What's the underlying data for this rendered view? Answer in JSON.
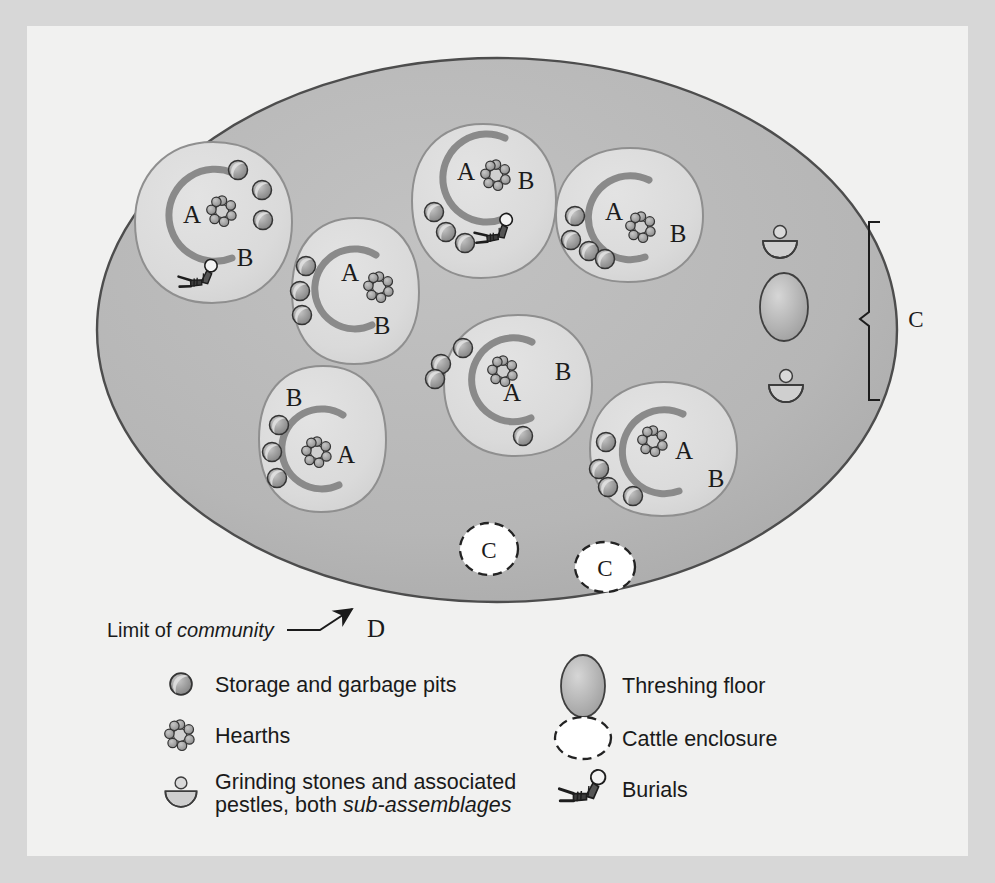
{
  "figure": {
    "zone_labels": {
      "house": "A",
      "yard": "B",
      "communal": "C",
      "community_limit": "D"
    },
    "annotation": {
      "prefix": "Limit of ",
      "italic": "community",
      "arrow_label": "D"
    },
    "colors": {
      "frame": "#d7d7d7",
      "plate": "#f1f1f0",
      "settlement_fill": "#b9b9b9",
      "settlement_stroke": "#4a4a4a",
      "household_fill": "#dcdcdc",
      "household_stroke": "#8d8d8d",
      "hut_wall": "#8a8a8a",
      "pit_fill": "#9a9a9a",
      "pit_stroke": "#3a3a3a",
      "hearth_stone": "#9e9e9e",
      "threshing_fill": "#b0b0b0",
      "enclosure_fill": "#ffffff",
      "enclosure_stroke": "#2c2c2c",
      "ink": "#1b1b1b"
    },
    "settlement": {
      "cx": 497,
      "cy": 330,
      "rx": 400,
      "ry": 272
    },
    "households": [
      {
        "id": "household-nw",
        "cx": 213,
        "cy": 222,
        "rx": 78,
        "ry": 80,
        "a_label": {
          "x": 192,
          "y": 215
        },
        "b_label": {
          "x": 245,
          "y": 258
        },
        "hearth": {
          "x": 222,
          "y": 211
        },
        "hut": {
          "cx": 210,
          "cy": 215,
          "r": 46,
          "start": 300,
          "end": 165
        },
        "pits": [
          {
            "x": 238,
            "y": 170
          },
          {
            "x": 261,
            "y": 190
          },
          {
            "x": 262,
            "y": 220
          }
        ],
        "burials": [
          {
            "x": 196,
            "y": 277,
            "rot": -12
          }
        ],
        "grinders": []
      },
      {
        "id": "household-n",
        "cx": 483,
        "cy": 200,
        "rx": 70,
        "ry": 78,
        "a_label": {
          "x": 466,
          "y": 172
        },
        "b_label": {
          "x": 523,
          "y": 180
        },
        "hearth": {
          "x": 496,
          "y": 175
        },
        "hut": {
          "cx": 483,
          "cy": 178,
          "r": 44,
          "start": 300,
          "end": 160
        },
        "pits": [
          {
            "x": 437,
            "y": 212
          },
          {
            "x": 448,
            "y": 230
          },
          {
            "x": 466,
            "y": 241
          }
        ],
        "burials": [
          {
            "x": 492,
            "y": 233,
            "rot": -14
          }
        ],
        "grinders": []
      },
      {
        "id": "household-ne",
        "cx": 628,
        "cy": 214,
        "rx": 72,
        "ry": 66,
        "a_label": {
          "x": 616,
          "y": 212
        },
        "b_label": {
          "x": 673,
          "y": 233
        },
        "hearth": {
          "x": 640,
          "y": 227
        },
        "hut": {
          "cx": 628,
          "cy": 218,
          "r": 42,
          "start": 300,
          "end": 155
        },
        "pits": [
          {
            "x": 576,
            "y": 215
          },
          {
            "x": 572,
            "y": 239
          },
          {
            "x": 589,
            "y": 250
          },
          {
            "x": 604,
            "y": 258
          }
        ],
        "burials": [],
        "grinders": []
      },
      {
        "id": "household-w",
        "cx": 355,
        "cy": 290,
        "rx": 62,
        "ry": 72,
        "a_label": {
          "x": 351,
          "y": 273
        },
        "b_label": {
          "x": 382,
          "y": 325
        },
        "hearth": {
          "x": 378,
          "y": 285
        },
        "hut": {
          "cx": 357,
          "cy": 287,
          "r": 40,
          "start": 300,
          "end": 160
        },
        "pits": [
          {
            "x": 307,
            "y": 265
          },
          {
            "x": 300,
            "y": 288
          },
          {
            "x": 301,
            "y": 310
          }
        ],
        "burials": [],
        "grinders": []
      },
      {
        "id": "household-center",
        "cx": 517,
        "cy": 385,
        "rx": 72,
        "ry": 70,
        "a_label": {
          "x": 513,
          "y": 393
        },
        "b_label": {
          "x": 561,
          "y": 371
        },
        "hearth": {
          "x": 503,
          "y": 370
        },
        "hut": {
          "cx": 512,
          "cy": 377,
          "r": 42,
          "start": 300,
          "end": 168
        },
        "pits": [
          {
            "x": 462,
            "y": 348
          },
          {
            "x": 441,
            "y": 364
          },
          {
            "x": 435,
            "y": 378
          },
          {
            "x": 522,
            "y": 436
          }
        ],
        "burials": [],
        "grinders": []
      },
      {
        "id": "household-sw",
        "cx": 322,
        "cy": 438,
        "rx": 62,
        "ry": 72,
        "a_label": {
          "x": 343,
          "y": 455
        },
        "b_label": {
          "x": 295,
          "y": 397
        },
        "hearth": {
          "x": 316,
          "y": 452
        },
        "hut": {
          "cx": 324,
          "cy": 447,
          "r": 40,
          "start": 300,
          "end": 165
        },
        "pits": [
          {
            "x": 280,
            "y": 424
          },
          {
            "x": 273,
            "y": 450
          },
          {
            "x": 277,
            "y": 476
          }
        ],
        "burials": [],
        "grinders": []
      },
      {
        "id": "household-se",
        "cx": 662,
        "cy": 447,
        "rx": 72,
        "ry": 62,
        "a_label": {
          "x": 681,
          "y": 451
        },
        "b_label": {
          "x": 713,
          "y": 478
        },
        "hearth": {
          "x": 653,
          "y": 442
        },
        "hut": {
          "cx": 662,
          "cy": 448,
          "r": 42,
          "start": 300,
          "end": 163
        },
        "pits": [
          {
            "x": 607,
            "y": 441
          },
          {
            "x": 600,
            "y": 468
          },
          {
            "x": 608,
            "y": 486
          },
          {
            "x": 632,
            "y": 495
          }
        ],
        "burials": [],
        "grinders": []
      }
    ],
    "threshing_floor": {
      "cx": 784,
      "cy": 307,
      "rx": 23,
      "ry": 33
    },
    "communal_grinders": [
      {
        "x": 780,
        "y": 238
      },
      {
        "x": 784,
        "y": 382
      }
    ],
    "communal_bracket": {
      "x": 872,
      "y_top": 222,
      "y_bottom": 400,
      "label": "C",
      "label_x": 916,
      "label_y": 319
    },
    "cattle_enclosures": [
      {
        "cx": 489,
        "cy": 549,
        "rx": 28,
        "ry": 25,
        "label": "C"
      },
      {
        "cx": 604,
        "cy": 567,
        "rx": 29,
        "ry": 24,
        "label": "C"
      }
    ]
  },
  "legend": {
    "columns": [
      {
        "id": "legend-column-left",
        "entries": [
          {
            "icon": "pit-icon",
            "label": "Storage and garbage pits",
            "lines": [
              "Storage and garbage pits"
            ],
            "italic_part": ""
          },
          {
            "icon": "hearth-icon",
            "label": "Hearths",
            "lines": [
              "Hearths"
            ],
            "italic_part": ""
          },
          {
            "icon": "grinding-stone-icon",
            "label": "Grinding stones and associated pestles, both sub-assemblages",
            "lines": [
              "Grinding stones and associated",
              "pestles, both "
            ],
            "italic_part": "sub-assemblages"
          }
        ]
      },
      {
        "id": "legend-column-right",
        "entries": [
          {
            "icon": "threshing-floor-icon",
            "label": "Threshing floor",
            "lines": [
              "Threshing floor"
            ],
            "italic_part": ""
          },
          {
            "icon": "cattle-enclosure-icon",
            "label": "Cattle enclosure",
            "lines": [
              "Cattle enclosure"
            ],
            "italic_part": ""
          },
          {
            "icon": "burial-icon",
            "label": "Burials",
            "lines": [
              "Burials"
            ],
            "italic_part": ""
          }
        ]
      }
    ]
  }
}
